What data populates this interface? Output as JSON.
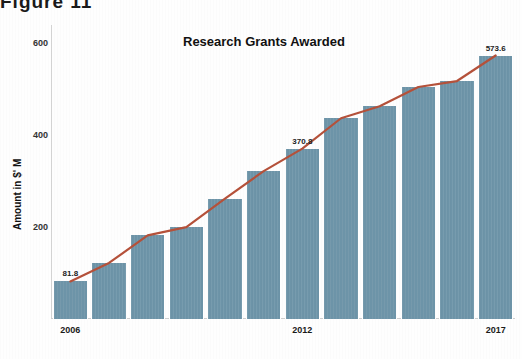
{
  "page": {
    "header_fragment": "Figure 11"
  },
  "chart_data": {
    "type": "bar",
    "title": "Research Grants Awarded",
    "xlabel": "",
    "ylabel": "Amount in $' M",
    "categories": [
      "2006",
      "2007",
      "2008",
      "2009",
      "2010",
      "2011",
      "2012",
      "2013",
      "2014",
      "2015",
      "2016",
      "2017"
    ],
    "values": [
      81.8,
      122.0,
      182.0,
      200.0,
      262.0,
      322.0,
      370.8,
      437.0,
      463.0,
      505.0,
      518.0,
      573.6
    ],
    "ylim": [
      0,
      640
    ],
    "yticks": [
      200,
      400,
      600
    ],
    "ytick_labels": [
      "200",
      "400",
      "600"
    ],
    "xtick_labels": [
      "2006",
      "2012",
      "2017"
    ],
    "xtick_indices": [
      0,
      6,
      11
    ],
    "grid": false,
    "legend": "none",
    "series": [
      {
        "name": "Amount awarded",
        "type": "bar",
        "color": "#6d94a8",
        "values": [
          81.8,
          122.0,
          182.0,
          200.0,
          262.0,
          322.0,
          370.8,
          437.0,
          463.0,
          505.0,
          518.0,
          573.6
        ]
      },
      {
        "name": "Trend",
        "type": "line",
        "color": "#b5513a",
        "values": [
          81.8,
          122.0,
          182.0,
          200.0,
          262.0,
          322.0,
          370.8,
          437.0,
          463.0,
          505.0,
          518.0,
          573.6
        ]
      }
    ],
    "data_labels": [
      {
        "index": 0,
        "text": "81.8"
      },
      {
        "index": 6,
        "text": "370.8"
      },
      {
        "index": 11,
        "text": "573.6"
      }
    ],
    "colors": {
      "bar": "#6d94a8",
      "line": "#b5513a",
      "axis": "#d0d0d0",
      "text": "#1a1a1a",
      "background": "#ffffff"
    }
  }
}
